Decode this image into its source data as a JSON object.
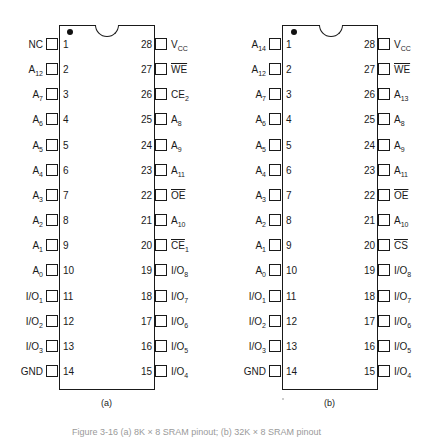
{
  "figure": {
    "caption": "Figure 3-16  (a) 8K × 8 SRAM pinout;  (b) 32K × 8 SRAM pinout",
    "line_color": "#1a1a1a",
    "background": "#ffffff"
  },
  "chips": [
    {
      "id": "a",
      "sub_label": "(a)",
      "package": "28-pin DIP",
      "left_pins": [
        {
          "num": "1",
          "name": "NC",
          "sub": "",
          "overline": false
        },
        {
          "num": "2",
          "name": "A",
          "sub": "12",
          "overline": false
        },
        {
          "num": "3",
          "name": "A",
          "sub": "7",
          "overline": false
        },
        {
          "num": "4",
          "name": "A",
          "sub": "6",
          "overline": false
        },
        {
          "num": "5",
          "name": "A",
          "sub": "5",
          "overline": false
        },
        {
          "num": "6",
          "name": "A",
          "sub": "4",
          "overline": false
        },
        {
          "num": "7",
          "name": "A",
          "sub": "3",
          "overline": false
        },
        {
          "num": "8",
          "name": "A",
          "sub": "2",
          "overline": false
        },
        {
          "num": "9",
          "name": "A",
          "sub": "1",
          "overline": false
        },
        {
          "num": "10",
          "name": "A",
          "sub": "0",
          "overline": false
        },
        {
          "num": "11",
          "name": "I/O",
          "sub": "1",
          "overline": false
        },
        {
          "num": "12",
          "name": "I/O",
          "sub": "2",
          "overline": false
        },
        {
          "num": "13",
          "name": "I/O",
          "sub": "3",
          "overline": false
        },
        {
          "num": "14",
          "name": "GND",
          "sub": "",
          "overline": false
        }
      ],
      "right_pins": [
        {
          "num": "28",
          "name": "V",
          "sub": "CC",
          "overline": false
        },
        {
          "num": "27",
          "name": "WE",
          "sub": "",
          "overline": true
        },
        {
          "num": "26",
          "name": "CE",
          "sub": "2",
          "overline": false
        },
        {
          "num": "25",
          "name": "A",
          "sub": "8",
          "overline": false
        },
        {
          "num": "24",
          "name": "A",
          "sub": "9",
          "overline": false
        },
        {
          "num": "23",
          "name": "A",
          "sub": "11",
          "overline": false
        },
        {
          "num": "22",
          "name": "OE",
          "sub": "",
          "overline": true
        },
        {
          "num": "21",
          "name": "A",
          "sub": "10",
          "overline": false
        },
        {
          "num": "20",
          "name": "CE",
          "sub": "1",
          "overline": true
        },
        {
          "num": "19",
          "name": "I/O",
          "sub": "8",
          "overline": false
        },
        {
          "num": "18",
          "name": "I/O",
          "sub": "7",
          "overline": false
        },
        {
          "num": "17",
          "name": "I/O",
          "sub": "6",
          "overline": false
        },
        {
          "num": "16",
          "name": "I/O",
          "sub": "5",
          "overline": false
        },
        {
          "num": "15",
          "name": "I/O",
          "sub": "4",
          "overline": false
        }
      ]
    },
    {
      "id": "b",
      "sub_label": "(b)",
      "package": "28-pin DIP",
      "left_pins": [
        {
          "num": "1",
          "name": "A",
          "sub": "14",
          "overline": false
        },
        {
          "num": "2",
          "name": "A",
          "sub": "12",
          "overline": false
        },
        {
          "num": "3",
          "name": "A",
          "sub": "7",
          "overline": false
        },
        {
          "num": "4",
          "name": "A",
          "sub": "6",
          "overline": false
        },
        {
          "num": "5",
          "name": "A",
          "sub": "5",
          "overline": false
        },
        {
          "num": "6",
          "name": "A",
          "sub": "4",
          "overline": false
        },
        {
          "num": "7",
          "name": "A",
          "sub": "3",
          "overline": false
        },
        {
          "num": "8",
          "name": "A",
          "sub": "2",
          "overline": false
        },
        {
          "num": "9",
          "name": "A",
          "sub": "1",
          "overline": false
        },
        {
          "num": "10",
          "name": "A",
          "sub": "0",
          "overline": false
        },
        {
          "num": "11",
          "name": "I/O",
          "sub": "1",
          "overline": false
        },
        {
          "num": "12",
          "name": "I/O",
          "sub": "2",
          "overline": false
        },
        {
          "num": "13",
          "name": "I/O",
          "sub": "3",
          "overline": false
        },
        {
          "num": "14",
          "name": "GND",
          "sub": "",
          "overline": false
        }
      ],
      "right_pins": [
        {
          "num": "28",
          "name": "V",
          "sub": "CC",
          "overline": false
        },
        {
          "num": "27",
          "name": "WE",
          "sub": "",
          "overline": true
        },
        {
          "num": "26",
          "name": "A",
          "sub": "13",
          "overline": false
        },
        {
          "num": "25",
          "name": "A",
          "sub": "8",
          "overline": false
        },
        {
          "num": "24",
          "name": "A",
          "sub": "9",
          "overline": false
        },
        {
          "num": "23",
          "name": "A",
          "sub": "11",
          "overline": false
        },
        {
          "num": "22",
          "name": "OE",
          "sub": "",
          "overline": true
        },
        {
          "num": "21",
          "name": "A",
          "sub": "10",
          "overline": false
        },
        {
          "num": "20",
          "name": "CS",
          "sub": "",
          "overline": true
        },
        {
          "num": "19",
          "name": "I/O",
          "sub": "8",
          "overline": false
        },
        {
          "num": "18",
          "name": "I/O",
          "sub": "7",
          "overline": false
        },
        {
          "num": "17",
          "name": "I/O",
          "sub": "6",
          "overline": false
        },
        {
          "num": "16",
          "name": "I/O",
          "sub": "5",
          "overline": false
        },
        {
          "num": "15",
          "name": "I/O",
          "sub": "4",
          "overline": false
        }
      ]
    }
  ]
}
